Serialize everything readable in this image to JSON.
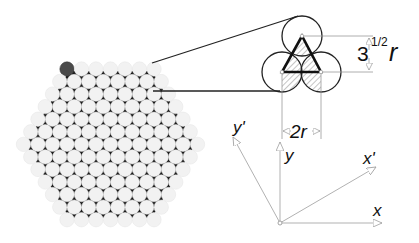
{
  "figure": {
    "width": 419,
    "height": 243,
    "colors": {
      "background": "#ffffff",
      "circle_fill": "#f2f2f2",
      "gap_fill": "#1a1a1a",
      "highlight_circle": "#4a4a4a",
      "outline": "#222222",
      "hatch": "#888888",
      "dim_line": "#9a9a9a",
      "axis_line": "#a8a8a8"
    }
  },
  "packing": {
    "description": "hexagonal close-packed bundle of fibers",
    "side_count": 7,
    "row_count": 13,
    "top_left_center": [
      67,
      69
    ],
    "pitch": 14.5,
    "radius": 7.2,
    "highlight_index": [
      0,
      0
    ]
  },
  "callout": {
    "line_top": [
      [
        152,
        63
      ],
      [
        298,
        16
      ]
    ],
    "line_bottom": [
      [
        153,
        91
      ],
      [
        280,
        91
      ]
    ]
  },
  "unit_cell": {
    "radius": 20,
    "circles": [
      [
        302,
        36
      ],
      [
        282,
        72
      ],
      [
        321,
        72
      ]
    ],
    "triangle": [
      [
        302,
        36
      ],
      [
        282,
        72
      ],
      [
        321,
        72
      ]
    ]
  },
  "dimensions": {
    "height_label_base": "3",
    "height_label_exp": "1/2",
    "height_label_var": "r",
    "width_label": "2r"
  },
  "axes": {
    "origin": [
      280,
      223
    ],
    "x": {
      "label": "x",
      "end": [
        382,
        223
      ]
    },
    "y": {
      "label": "y",
      "end": [
        280,
        142
      ]
    },
    "x_prime": {
      "label": "x'",
      "end": [
        376,
        167
      ]
    },
    "y_prime": {
      "label": "y'",
      "end": [
        233,
        137
      ]
    }
  }
}
